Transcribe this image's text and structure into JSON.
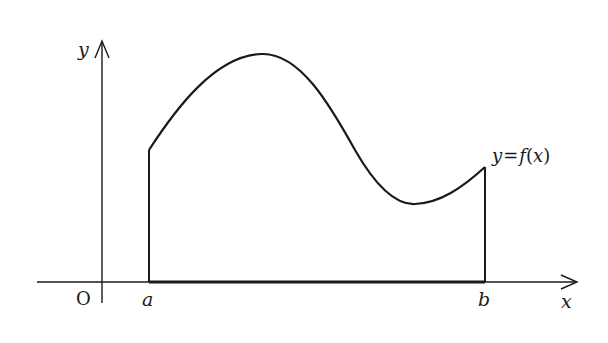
{
  "diagram": {
    "colors": {
      "stroke": "#1a1a1a",
      "background": "#ffffff"
    },
    "axes": {
      "x_label": "x",
      "y_label": "y",
      "origin_label": "O"
    },
    "bounds": {
      "left_label": "a",
      "right_label": "b"
    },
    "curve": {
      "label_var": "y",
      "label_eq": "=",
      "label_func": "f",
      "label_open": "(",
      "label_arg": "x",
      "label_close": ")",
      "label_full": "y=f(x)"
    }
  }
}
